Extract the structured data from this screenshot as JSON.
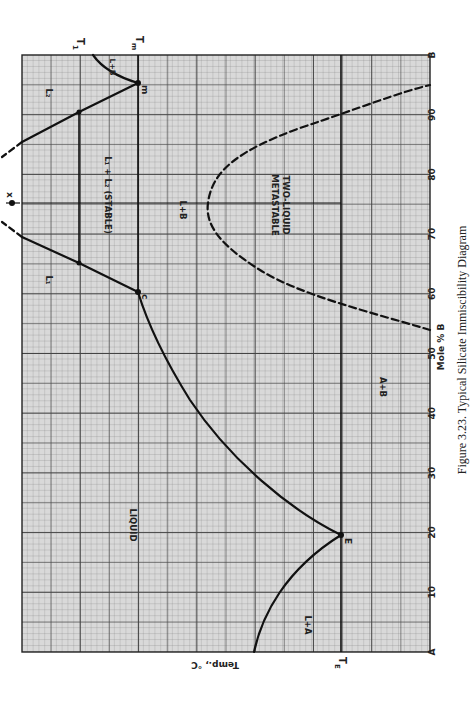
{
  "chart_data": {
    "type": "line",
    "title": "Figure 3.23. Typical Silicate Immiscibility Diagram",
    "xlabel": "Mole % B",
    "ylabel": "Temp., °C",
    "xlim": [
      0,
      100
    ],
    "x_ticks": [
      "A",
      "10",
      "20",
      "30",
      "40",
      "50",
      "60",
      "70",
      "80",
      "90",
      "B"
    ],
    "x_tick_values": [
      0,
      10,
      20,
      30,
      40,
      50,
      60,
      70,
      80,
      90,
      100
    ],
    "temperature_markers": [
      {
        "name": "T_E",
        "label": "T",
        "sub": "E",
        "level": 0.25
      },
      {
        "name": "T_m",
        "label": "T",
        "sub": "m",
        "level": 0.7
      },
      {
        "name": "T_1",
        "label": "T",
        "sub": "1",
        "level": 0.82
      }
    ],
    "grid": true,
    "rotation": "rotated 90° clockwise on page",
    "series": [
      {
        "name": "Liquidus L+A",
        "style": "solid",
        "points": [
          [
            4.5,
            0.35
          ],
          [
            10,
            0.31
          ],
          [
            15,
            0.28
          ],
          [
            20,
            0.25
          ]
        ]
      },
      {
        "name": "Liquidus L+B (lower)",
        "style": "solid",
        "points": [
          [
            20,
            0.25
          ],
          [
            30,
            0.38
          ],
          [
            40,
            0.48
          ],
          [
            50,
            0.58
          ],
          [
            55,
            0.64
          ],
          [
            60,
            0.7
          ]
        ]
      },
      {
        "name": "Binodal L1 side",
        "style": "solid",
        "points": [
          [
            60,
            0.7
          ],
          [
            65,
            0.82
          ],
          [
            71,
            0.93
          ]
        ]
      },
      {
        "name": "Binodal L2 side",
        "style": "solid",
        "points": [
          [
            95,
            0.7
          ],
          [
            90,
            0.82
          ],
          [
            85,
            0.93
          ]
        ]
      },
      {
        "name": "Binodal extension (dashed)",
        "style": "dashed",
        "points": [
          [
            71,
            0.93
          ],
          [
            75,
            1.0
          ],
          [
            85,
            0.93
          ]
        ]
      },
      {
        "name": "Liquidus L+B (upper)",
        "style": "solid",
        "points": [
          [
            95,
            0.7
          ],
          [
            98,
            0.76
          ],
          [
            100,
            0.8
          ]
        ]
      },
      {
        "name": "Metastable two-liquid dome",
        "style": "dashed",
        "points": [
          [
            54,
            0.0
          ],
          [
            58,
            0.25
          ],
          [
            65,
            0.45
          ],
          [
            75,
            0.52
          ],
          [
            85,
            0.45
          ],
          [
            91,
            0.25
          ],
          [
            95.5,
            0.0
          ]
        ]
      }
    ],
    "points": [
      {
        "label": "E",
        "x": 20,
        "note": "eutectic at T_E"
      },
      {
        "label": "c",
        "x": 60,
        "note": "monotectic at T_m"
      },
      {
        "label": "m",
        "x": 95,
        "note": "at T_m"
      },
      {
        "label": "x",
        "x": 75,
        "note": "consolute point"
      }
    ],
    "regions": [
      "LIQUID",
      "L+A",
      "A+B",
      "L+B",
      "L₁ + L₂ (STABLE)",
      "L₁",
      "L₂",
      "L+B",
      "METASTABLE TWO-LIQUID"
    ]
  },
  "labels": {
    "ylabel": "Temp., °C",
    "xlabel": "Mole % B",
    "caption": "Figure 3.23.  Typical Silicate Immiscibility Diagram",
    "T": "T",
    "TE_sub": "E",
    "Tm_sub": "m",
    "T1_sub": "1",
    "x_point": "x",
    "E_point": "E",
    "c_point": "c",
    "m_point": "m",
    "liquid": "LIQUID",
    "LA": "L+A",
    "AB": "A+B",
    "LB": "L+B",
    "LB_top": "L+B",
    "stable": "L₁ + L₂ (STABLE)",
    "L1": "L₁",
    "L2": "L₂",
    "meta1": "METASTABLE",
    "meta2": "TWO-LIQUID",
    "ticks": [
      "A",
      "10",
      "20",
      "30",
      "40",
      "50",
      "60",
      "70",
      "80",
      "90",
      "B"
    ]
  }
}
